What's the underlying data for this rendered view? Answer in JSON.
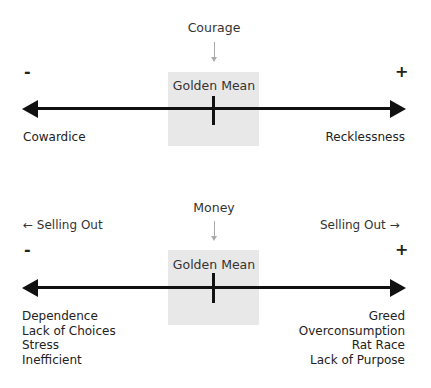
{
  "diagrams": [
    {
      "title": "Courage",
      "center_label": "Golden Mean",
      "minus_sign": "-",
      "plus_sign": "+",
      "left_extreme": "Cowardice",
      "right_extreme": "Recklessness"
    },
    {
      "title": "Money",
      "center_label": "Golden Mean",
      "minus_sign": "-",
      "plus_sign": "+",
      "left_direction": "← Selling Out",
      "right_direction": "Selling Out →",
      "left_extremes": [
        "Dependence",
        "Lack of Choices",
        "Stress",
        "Inefficient"
      ],
      "right_extremes": [
        "Greed",
        "Overconsumption",
        "Rat Race",
        "Lack of Purpose"
      ]
    }
  ],
  "colors": {
    "axis": "#111111",
    "mean_box": "#e8e8e8",
    "pointer_arrow": "#aaaaaa"
  }
}
